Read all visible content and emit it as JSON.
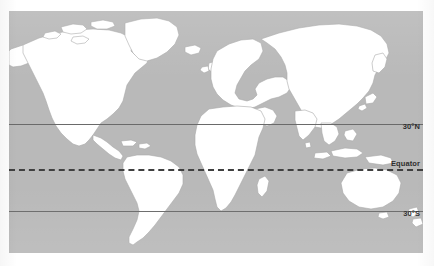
{
  "figure": {
    "type": "world-map",
    "projection": "equirectangular",
    "title": ""
  },
  "colors": {
    "ocean": "#b9b9b9",
    "land": "#ffffff",
    "land_outline": "#9a9a9a",
    "line_solid": "#6a6a6a",
    "line_dashed": "#3f3f3f",
    "label_text": "#2e2e2e",
    "page_background": "#ffffff"
  },
  "latitude_lines": [
    {
      "id": "30n",
      "label": "30°N",
      "style": "solid",
      "latitude": 30,
      "hemisphere": "N"
    },
    {
      "id": "equator",
      "label": "Equator",
      "style": "dashed",
      "latitude": 0,
      "hemisphere": ""
    },
    {
      "id": "30s",
      "label": "30°S",
      "style": "solid",
      "latitude": -30,
      "hemisphere": "S"
    }
  ],
  "landmasses": [
    "North America",
    "Greenland",
    "South America",
    "Africa",
    "Europe",
    "Asia",
    "Australia",
    "New Zealand",
    "Japan",
    "Indonesia",
    "Madagascar",
    "British Isles",
    "Iceland"
  ]
}
